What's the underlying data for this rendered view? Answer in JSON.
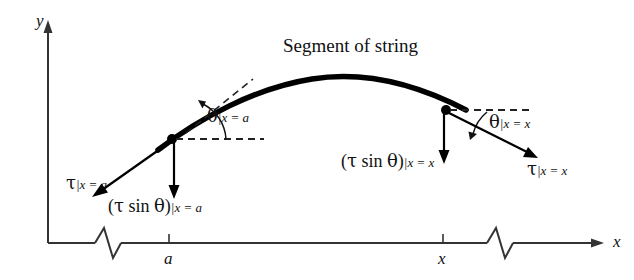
{
  "figure": {
    "title": "Segment of string",
    "axes": {
      "y_label": "y",
      "x_label": "x"
    },
    "ticks": [
      {
        "name": "tick-a",
        "label": "a",
        "x": 169
      },
      {
        "name": "tick-x",
        "label": "x",
        "x": 443
      }
    ],
    "labels": {
      "theta_left": {
        "greek": "θ",
        "sub": "|x = a"
      },
      "theta_right": {
        "greek": "θ",
        "sub": "|x = x"
      },
      "tau_left": {
        "greek": "τ",
        "sub": "|x = a"
      },
      "tau_right": {
        "greek": "τ",
        "sub": "|x = x"
      },
      "tau_sin_left": {
        "open": "(",
        "tau": "τ",
        "sin": " sin ",
        "theta": "θ",
        "close": ")",
        "sub": "|x = a"
      },
      "tau_sin_right": {
        "open": "(",
        "tau": "τ",
        "sin": " sin ",
        "theta": "θ",
        "close": ")",
        "sub": "|x = x"
      }
    },
    "colors": {
      "ink": "#111111",
      "curve": "#000000",
      "axis": "#333333",
      "dashed": "#222222"
    }
  }
}
